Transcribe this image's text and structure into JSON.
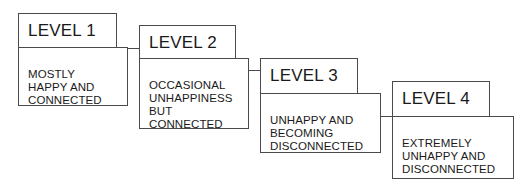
{
  "diagram": {
    "type": "staircase-levels",
    "levels": [
      {
        "title": "LEVEL 1",
        "description": "MOSTLY\nHAPPY AND\nCONNECTED"
      },
      {
        "title": "LEVEL 2",
        "description": "OCCASIONAL\nUNHAPPINESS\nBUT\nCONNECTED"
      },
      {
        "title": "LEVEL 3",
        "description": "UNHAPPY AND\nBECOMING\nDISCONNECTED"
      },
      {
        "title": "LEVEL 4",
        "description": "EXTREMELY\nUNHAPPY AND\nDISCONNECTED"
      }
    ],
    "colors": {
      "border": "#4a4a4a",
      "text": "#1a1a1a",
      "background": "#ffffff"
    }
  }
}
